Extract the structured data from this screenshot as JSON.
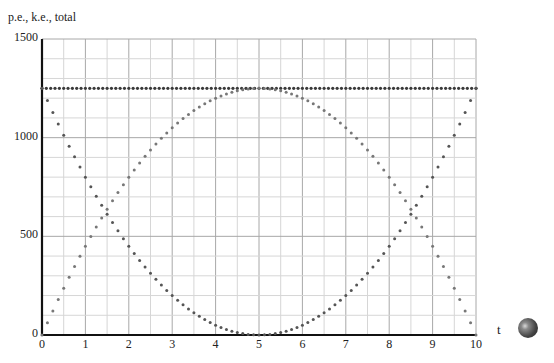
{
  "chart_data": {
    "type": "scatter",
    "title": "",
    "ylabel": "p.e., k.e., total",
    "xlabel": "t",
    "xlim": [
      0,
      10
    ],
    "ylim": [
      0,
      1500
    ],
    "x_ticks": [
      "0",
      "1",
      "2",
      "3",
      "4",
      "5",
      "6",
      "7",
      "8",
      "9",
      "10"
    ],
    "y_ticks": [
      "0",
      "500",
      "1000",
      "1500"
    ],
    "grid": true,
    "grid_minor_x": 0.5,
    "grid_minor_y": 100,
    "series": [
      {
        "name": "total",
        "formula": "1250",
        "t_step": 0.1,
        "color": "#3a3a3a",
        "points_sample": [
          [
            0,
            1250
          ],
          [
            5,
            1250
          ],
          [
            10,
            1250
          ]
        ]
      },
      {
        "name": "k.e.",
        "formula": "50*(t-5)^2",
        "t_step": 0.125,
        "color": "#555555",
        "points_sample": [
          [
            0,
            1250
          ],
          [
            1,
            800
          ],
          [
            2,
            450
          ],
          [
            3,
            200
          ],
          [
            4,
            50
          ],
          [
            5,
            0
          ],
          [
            6,
            50
          ],
          [
            7,
            200
          ],
          [
            8,
            450
          ],
          [
            9,
            800
          ],
          [
            10,
            1250
          ]
        ]
      },
      {
        "name": "p.e.",
        "formula": "1250-50*(t-5)^2",
        "t_step": 0.125,
        "color": "#777777",
        "points_sample": [
          [
            0,
            0
          ],
          [
            1,
            450
          ],
          [
            2,
            800
          ],
          [
            3,
            1050
          ],
          [
            4,
            1200
          ],
          [
            5,
            1250
          ],
          [
            6,
            1200
          ],
          [
            7,
            1050
          ],
          [
            8,
            800
          ],
          [
            9,
            450
          ],
          [
            10,
            0
          ]
        ]
      }
    ]
  },
  "labels": {
    "y_title": "p.e., k.e., total",
    "x_title": "t"
  },
  "controls": {
    "ball_icon": "play-sphere"
  }
}
